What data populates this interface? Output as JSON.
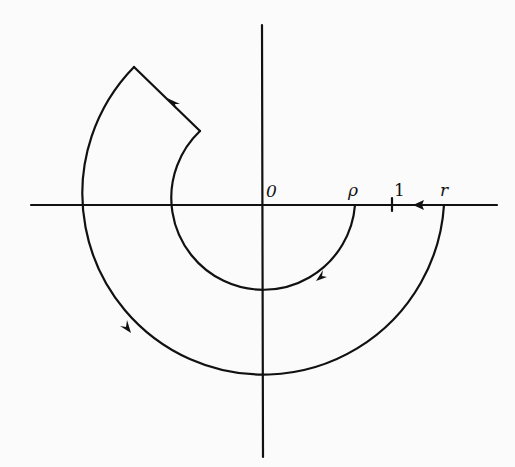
{
  "figure": {
    "labels": {
      "origin": "0",
      "inner_radius": "ρ",
      "unit": "1",
      "outer_radius": "r"
    },
    "colors": {
      "stroke": "#111111",
      "background": "#fbfbfb"
    },
    "geometry": {
      "center": [
        263,
        205
      ],
      "inner_radius_px": 92,
      "outer_radius_px": 181
    }
  }
}
